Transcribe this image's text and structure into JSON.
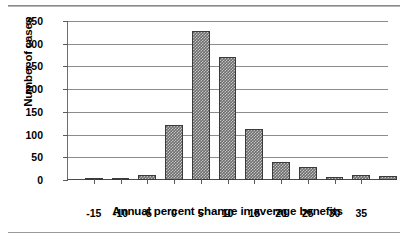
{
  "chart_data": {
    "type": "bar",
    "title": "",
    "xlabel": "Annual percent change in average benefits",
    "ylabel": "Number of cases",
    "xlim": [
      -20,
      40
    ],
    "ylim": [
      0,
      350
    ],
    "ytick_labels": [
      "0",
      "50",
      "100",
      "150",
      "200",
      "250",
      "300",
      "350"
    ],
    "ytick_values": [
      0,
      50,
      100,
      150,
      200,
      250,
      300,
      350
    ],
    "xtick_labels": [
      "-15",
      "-10",
      "-5",
      "0",
      "5",
      "10",
      "15",
      "20",
      "25",
      "30",
      "35"
    ],
    "xtick_values": [
      -15,
      -10,
      -5,
      0,
      5,
      10,
      15,
      20,
      25,
      30,
      35
    ],
    "grid": true,
    "legend": false,
    "bin_width": 5,
    "bin_starts": [
      -17.5,
      -12.5,
      -7.5,
      -2.5,
      2.5,
      7.5,
      12.5,
      17.5,
      22.5,
      27.5,
      32.5,
      37.5
    ],
    "categories": [
      "-17.5",
      "-12.5",
      "-7.5",
      "-2.5",
      "2.5",
      "7.5",
      "12.5",
      "17.5",
      "22.5",
      "27.5",
      "32.5",
      "37.5"
    ],
    "values": [
      2,
      5,
      12,
      122,
      327,
      270,
      113,
      40,
      28,
      7,
      10,
      8
    ],
    "bar_color": "#6d6d6d",
    "bar_edge_color": "#3b3b3b",
    "grid_color": "#8c8c8c",
    "axis_color": "#4a4a4a"
  }
}
